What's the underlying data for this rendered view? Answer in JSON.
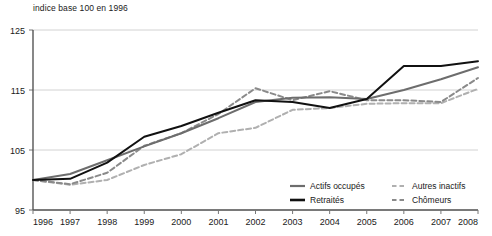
{
  "axis_note": "indice base 100 en 1996",
  "legend": {
    "items": [
      {
        "label": "Actifs occupés",
        "key": "actifs_occupes",
        "color": "#6d6d6d",
        "style": "solid"
      },
      {
        "label": "Retraités",
        "key": "retraites",
        "color": "#111111",
        "style": "solid"
      },
      {
        "label": "Autres inactifs",
        "key": "autres_inactifs",
        "color": "#b0b0b0",
        "style": "dashed"
      },
      {
        "label": "Chômeurs",
        "key": "chomeurs",
        "color": "#8a8a8a",
        "style": "dashed"
      }
    ]
  },
  "chart_data": {
    "type": "line",
    "title": "",
    "subtitle": "",
    "xlabel": "",
    "ylabel": "indice base 100 en 1996",
    "xlim": [
      1996,
      2008
    ],
    "ylim": [
      95,
      125
    ],
    "yticks": [
      95,
      105,
      115,
      125
    ],
    "xticks": [
      1996,
      1997,
      1998,
      1999,
      2000,
      2001,
      2002,
      2003,
      2004,
      2005,
      2006,
      2007,
      2008
    ],
    "ytick_labels": [
      "95",
      "105",
      "115",
      "125"
    ],
    "xtick_labels": [
      "1996",
      "1997",
      "1998",
      "1999",
      "2000",
      "2001",
      "2002",
      "2003",
      "2004",
      "2005",
      "2006",
      "2007",
      "2008"
    ],
    "grid": true,
    "grid_axis": "y",
    "legend_position": "bottom-right",
    "x": [
      1996,
      1997,
      1998,
      1999,
      2000,
      2001,
      2002,
      2003,
      2004,
      2005,
      2006,
      2007,
      2008
    ],
    "series": [
      {
        "name": "Actifs occupés",
        "color": "#6d6d6d",
        "style": "solid",
        "width": 2,
        "values": [
          100.0,
          101.0,
          103.3,
          105.6,
          107.8,
          110.3,
          113.0,
          113.7,
          113.8,
          113.5,
          115.0,
          116.8,
          118.8
        ]
      },
      {
        "name": "Retraités",
        "color": "#111111",
        "style": "solid",
        "width": 2,
        "values": [
          100.0,
          100.2,
          102.9,
          107.2,
          109.0,
          111.2,
          113.3,
          113.0,
          112.0,
          113.5,
          119.0,
          119.0,
          119.8
        ]
      },
      {
        "name": "Autres inactifs",
        "color": "#b0b0b0",
        "style": "dashed",
        "width": 2,
        "values": [
          100.0,
          99.2,
          100.0,
          102.5,
          104.3,
          107.8,
          108.7,
          111.7,
          112.0,
          112.7,
          112.8,
          112.8,
          115.2
        ]
      },
      {
        "name": "Chômeurs",
        "color": "#8a8a8a",
        "style": "dashed",
        "width": 2,
        "values": [
          100.0,
          99.3,
          101.2,
          105.7,
          107.8,
          111.0,
          115.3,
          113.3,
          114.8,
          113.3,
          113.3,
          113.0,
          117.0
        ]
      }
    ]
  }
}
